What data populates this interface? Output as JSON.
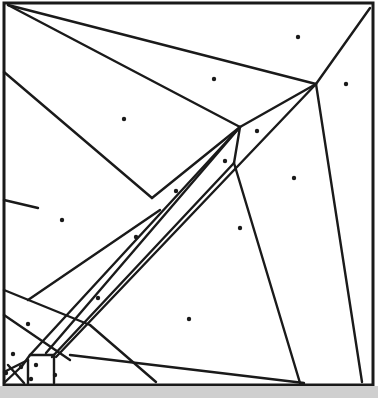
{
  "diagram": {
    "type": "voronoi-partition",
    "colors": {
      "line": "#1a1a1a",
      "site": "#1a1a1a",
      "background": "#ffffff"
    },
    "frame": {
      "x1": 4,
      "y1": 3,
      "x2": 373,
      "y2": 385
    },
    "sites": [
      [
        298,
        37
      ],
      [
        214,
        79
      ],
      [
        346,
        84
      ],
      [
        124,
        119
      ],
      [
        257,
        131
      ],
      [
        225,
        161
      ],
      [
        294,
        178
      ],
      [
        176,
        191
      ],
      [
        62,
        220
      ],
      [
        240,
        228
      ],
      [
        136,
        237
      ],
      [
        98,
        298
      ],
      [
        189,
        319
      ],
      [
        28,
        324
      ],
      [
        13,
        354
      ],
      [
        36,
        365
      ],
      [
        55,
        375
      ],
      [
        6,
        373
      ],
      [
        21,
        367
      ],
      [
        31,
        379
      ]
    ],
    "edges": [
      [
        8,
        5,
        316,
        84
      ],
      [
        8,
        5,
        240,
        127
      ],
      [
        4,
        72,
        152,
        198
      ],
      [
        152,
        198,
        240,
        127
      ],
      [
        240,
        127,
        316,
        84
      ],
      [
        316,
        84,
        370,
        8
      ],
      [
        240,
        127,
        234,
        163
      ],
      [
        316,
        84,
        362,
        382
      ],
      [
        234,
        163,
        300,
        383
      ],
      [
        4,
        200,
        38,
        208
      ],
      [
        28,
        300,
        160,
        210
      ],
      [
        70,
        355,
        304,
        383
      ],
      [
        240,
        127,
        30,
        355
      ],
      [
        240,
        127,
        46,
        353
      ],
      [
        234,
        163,
        52,
        357
      ],
      [
        316,
        84,
        56,
        357
      ],
      [
        4,
        290,
        90,
        325
      ],
      [
        90,
        325,
        156,
        382
      ],
      [
        4,
        315,
        70,
        360
      ],
      [
        30,
        355,
        54,
        355
      ],
      [
        54,
        355,
        54,
        383
      ],
      [
        28,
        360,
        28,
        383
      ],
      [
        4,
        372,
        28,
        360
      ],
      [
        4,
        383,
        22,
        366
      ],
      [
        8,
        365,
        24,
        383
      ],
      [
        22,
        366,
        30,
        355
      ]
    ]
  }
}
